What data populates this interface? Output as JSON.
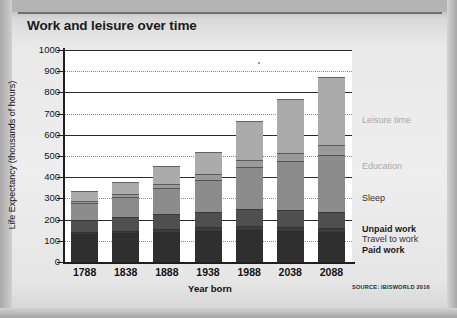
{
  "title": "Work and leisure over time",
  "source": "SOURCE: IBISWORLD 2016",
  "axes": {
    "ytitle": "Life Expectancy (thousands of hours)",
    "xtitle": "Year born",
    "yticks": [
      "1000",
      "900",
      "800",
      "700",
      "600",
      "500",
      "400",
      "300",
      "200",
      "100",
      "0"
    ]
  },
  "legend": [
    {
      "label": "Leisure time",
      "color": "#a8a8a8",
      "weight": "normal",
      "top": 115
    },
    {
      "label": "Education",
      "color": "#a8a8a8",
      "weight": "normal",
      "top": 161
    },
    {
      "label": "Sleep",
      "color": "#333333",
      "weight": "normal",
      "top": 193
    },
    {
      "label": "Unpaid work",
      "color": "#1b1b1b",
      "weight": "bold",
      "top": 224
    },
    {
      "label": "Travel to work",
      "color": "#333333",
      "weight": "normal",
      "top": 234
    },
    {
      "label": "Paid work",
      "color": "#1b1b1b",
      "weight": "bold",
      "top": 245
    }
  ],
  "chart_data": {
    "type": "bar",
    "subtype": "stacked-bar",
    "title": "Work and leisure over time",
    "xlabel": "Year born",
    "ylabel": "Life Expectancy (thousands of hours)",
    "ylim": [
      0,
      1000
    ],
    "ytick_step": 100,
    "grid": true,
    "legend_position": "right",
    "categories": [
      "1788",
      "1838",
      "1888",
      "1938",
      "1988",
      "2038",
      "2088"
    ],
    "totals": [
      335,
      380,
      455,
      520,
      665,
      770,
      875
    ],
    "series": [
      {
        "name": "Paid work",
        "color": "#2f2f2f",
        "values": [
          130,
          135,
          140,
          145,
          150,
          145,
          140
        ]
      },
      {
        "name": "Travel to work",
        "color": "#3c3c3c",
        "values": [
          10,
          12,
          15,
          18,
          22,
          22,
          20
        ]
      },
      {
        "name": "Unpaid work",
        "color": "#4f4f4f",
        "values": [
          60,
          65,
          70,
          75,
          80,
          78,
          75
        ]
      },
      {
        "name": "Sleep",
        "color": "#8c8c8c",
        "values": [
          80,
          95,
          125,
          150,
          195,
          230,
          270
        ]
      },
      {
        "name": "Education",
        "color": "#9a9a9a",
        "values": [
          10,
          13,
          20,
          27,
          33,
          40,
          45
        ]
      },
      {
        "name": "Leisure time",
        "color": "#ababab",
        "values": [
          45,
          60,
          85,
          105,
          185,
          255,
          325
        ]
      }
    ]
  }
}
